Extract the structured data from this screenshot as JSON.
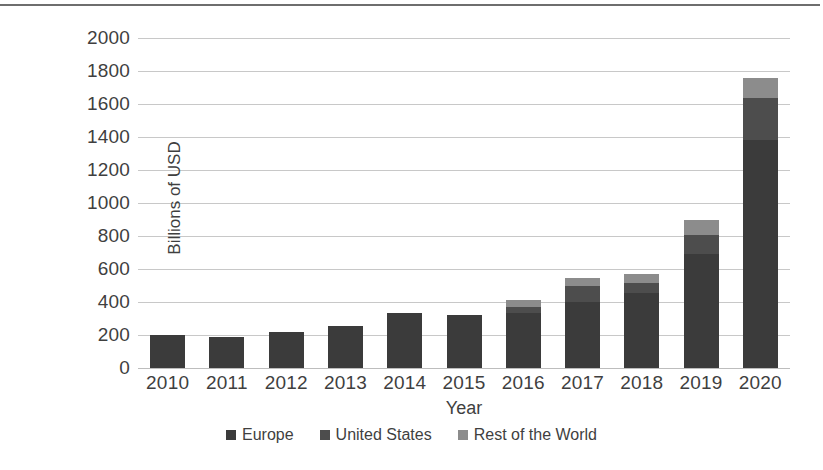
{
  "chart_data": {
    "type": "bar",
    "subtype": "stacked-column",
    "title": "",
    "xlabel": "Year",
    "ylabel": "Billions of USD",
    "categories": [
      "2010",
      "2011",
      "2012",
      "2013",
      "2014",
      "2015",
      "2016",
      "2017",
      "2018",
      "2019",
      "2020"
    ],
    "series": [
      {
        "name": "Europe",
        "color": "#3b3b3b",
        "values": [
          200,
          190,
          218,
          255,
          333,
          320,
          333,
          400,
          455,
          690,
          1380
        ]
      },
      {
        "name": "United States",
        "color": "#4d4d4d",
        "values": [
          0,
          0,
          0,
          0,
          0,
          0,
          37,
          95,
          60,
          115,
          255
        ]
      },
      {
        "name": "Rest of the World",
        "color": "#8c8c8c",
        "values": [
          0,
          0,
          0,
          0,
          0,
          0,
          40,
          50,
          55,
          90,
          120
        ]
      }
    ],
    "totals": [
      200,
      190,
      218,
      255,
      333,
      320,
      410,
      545,
      570,
      895,
      1755
    ],
    "ylim": [
      0,
      2000
    ],
    "yticks": [
      0,
      200,
      400,
      600,
      800,
      1000,
      1200,
      1400,
      1600,
      1800,
      2000
    ],
    "ytick_labels": [
      "0",
      "200",
      "400",
      "600",
      "800",
      "1000",
      "1200",
      "1400",
      "1600",
      "1800",
      "2000"
    ],
    "grid": true,
    "grid_color": "#c8c8c8",
    "legend_position": "bottom",
    "background": "#ffffff"
  },
  "axes": {
    "y_title": "Billions of USD",
    "x_title": "Year"
  },
  "legend": {
    "items": [
      {
        "label": "Europe",
        "color": "#3b3b3b"
      },
      {
        "label": "United States",
        "color": "#4d4d4d"
      },
      {
        "label": "Rest of the World",
        "color": "#8c8c8c"
      }
    ]
  }
}
